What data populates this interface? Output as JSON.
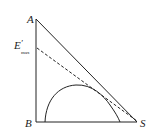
{
  "diagram": {
    "type": "ternary-phase-diagram",
    "vertices": {
      "A": "A",
      "B": "B",
      "S": "S"
    },
    "marker_label": {
      "main": "E",
      "prime": "′",
      "subscript": "max"
    },
    "elements": [
      "triangle-ABS",
      "dashed-line-Emax-to-S",
      "solubility-curve"
    ],
    "colors": {
      "line": "#222222",
      "background": "#ffffff"
    }
  }
}
